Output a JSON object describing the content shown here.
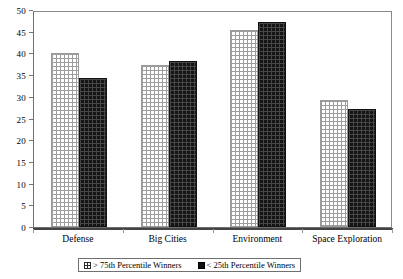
{
  "chart_data": {
    "type": "bar",
    "title": "",
    "subtitle": "",
    "xlabel": "",
    "ylabel": "",
    "ylim": [
      0,
      50
    ],
    "ytick_step": 5,
    "yticks": [
      "50",
      "45",
      "40",
      "35",
      "30",
      "25",
      "20",
      "15",
      "10",
      "5",
      "0"
    ],
    "grid": false,
    "legend_position": "bottom",
    "categories": [
      "Defense",
      "Big Cities",
      "Environment",
      "Space Exploration"
    ],
    "series": [
      {
        "name": "> 75th Percentile Winners",
        "pattern": "light-crosshatch",
        "color": "#ffffff",
        "values": [
          40.1,
          37.4,
          45.5,
          29.3
        ]
      },
      {
        "name": "< 25th Percentile Winners",
        "pattern": "solid-dark",
        "color": "#141414",
        "values": [
          34.4,
          38.2,
          47.3,
          27.2
        ]
      }
    ]
  },
  "legend": {
    "items": [
      {
        "label": "> 75th Percentile Winners",
        "swatch": "light-crosshatch-swatch"
      },
      {
        "label": "< 25th Percentile Winners",
        "swatch": "solid-dark-swatch"
      }
    ]
  }
}
